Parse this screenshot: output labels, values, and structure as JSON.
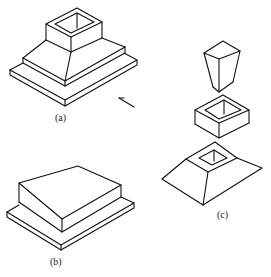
{
  "figure": {
    "labels": {
      "a": "(a)",
      "b": "(b)",
      "c": "(c)"
    },
    "colors": {
      "line": "#111111",
      "background": "#ffffff"
    },
    "parts": {
      "a": "assembled stepped base with frustum and hollow square collar",
      "b": "two-tier rectangular slab",
      "c": "exploded view: tapered hollow insert, square collar, frustum base with square hole"
    }
  }
}
